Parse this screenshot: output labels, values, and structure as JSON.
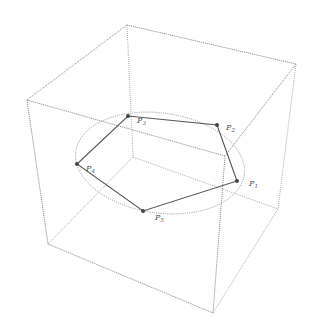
{
  "diagram": {
    "type": "cube-with-inscribed-pentagon",
    "colors": {
      "background": "#ffffff",
      "cube_edges": "#8a8a8a",
      "ellipse": "#909090",
      "pentagon": "#555555",
      "labels": "#555555"
    },
    "cube": {
      "vertices": {
        "top_back_left": [
          127,
          25
        ],
        "top_back_right": [
          296,
          64
        ],
        "top_front_left": [
          27,
          100
        ],
        "top_front_right": [
          225,
          156
        ],
        "bottom_back_left": [
          133,
          157
        ],
        "bottom_back_right": [
          278,
          209
        ],
        "bottom_front_left": [
          48,
          244
        ],
        "bottom_front_right": [
          213,
          313
        ]
      }
    },
    "ellipse": {
      "cx": 160,
      "cy": 163,
      "rx": 85,
      "ry": 50
    },
    "points": [
      {
        "id": "P1",
        "base": "P",
        "sub": "1",
        "x": 237,
        "y": 181,
        "lx": 249,
        "ly": 186
      },
      {
        "id": "P2",
        "base": "P",
        "sub": "2",
        "x": 217,
        "y": 125,
        "lx": 226,
        "ly": 130
      },
      {
        "id": "P3",
        "base": "P",
        "sub": "3",
        "x": 128,
        "y": 116,
        "lx": 137,
        "ly": 123
      },
      {
        "id": "P4",
        "base": "P",
        "sub": "4",
        "x": 77,
        "y": 164,
        "lx": 86,
        "ly": 171
      },
      {
        "id": "P5",
        "base": "P",
        "sub": "5",
        "x": 143,
        "y": 211,
        "lx": 155,
        "ly": 220
      }
    ]
  }
}
